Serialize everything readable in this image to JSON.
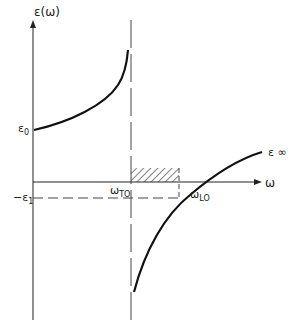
{
  "diagram": {
    "y_axis_label": "ε(ω)",
    "x_axis_label": "ω",
    "labels": {
      "eps0": "ε",
      "eps0_sub": "0",
      "eps_inf": "ε ∞",
      "neg_eps1": "−ε",
      "neg_eps1_sub": "1",
      "omega_to": "ω",
      "omega_to_sub": "TO",
      "omega_lo": "ω",
      "omega_lo_sub": "LO"
    },
    "colors": {
      "line": "#222222",
      "dash": "#444444",
      "hatch": "#333333"
    }
  }
}
